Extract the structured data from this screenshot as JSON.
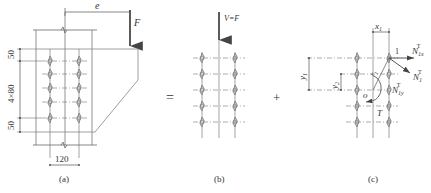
{
  "figure": {
    "panels": [
      {
        "id": "a",
        "caption": "(a)",
        "labels": {
          "eccentricity": "e",
          "force": "F",
          "dim_top": "50",
          "dim_middle": "4×80",
          "dim_bottom": "50",
          "dim_width": "120"
        },
        "bolt_grid": {
          "columns": 2,
          "rows": 5
        }
      },
      {
        "id": "b",
        "caption": "(b)",
        "labels": {
          "force": "V=F"
        },
        "bolt_grid": {
          "columns": 2,
          "rows": 5
        }
      },
      {
        "id": "c",
        "caption": "(c)",
        "labels": {
          "x1": "x",
          "x1_sub": "1",
          "y1": "y",
          "y1_sub": "1",
          "y2": "y",
          "y2_sub": "2",
          "r1": "r",
          "r1_sub": "1",
          "bolt_index": "1",
          "origin": "o",
          "torque": "T",
          "n1x": "N",
          "n1x_sub": "1x",
          "n1x_sup": "T",
          "n1": "N",
          "n1_sub": "1",
          "n1_sup": "T",
          "n1y": "N",
          "n1y_sub": "1y",
          "n1y_sup": "T"
        },
        "bolt_grid": {
          "columns": 2,
          "rows": 5
        }
      }
    ],
    "operators": {
      "equals": "=",
      "plus": "+"
    },
    "colors": {
      "line": "#555555",
      "bolt": "#777777",
      "text": "#333333"
    }
  }
}
